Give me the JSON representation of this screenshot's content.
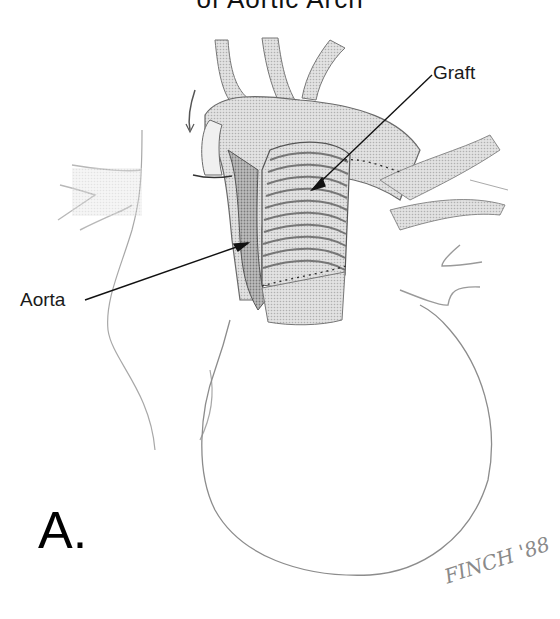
{
  "figure": {
    "title_partial": "of Aortic Arch",
    "panel_label": "A.",
    "signature": "FINCH '88",
    "labels": [
      {
        "id": "graft",
        "text": "Graft"
      },
      {
        "id": "aorta",
        "text": "Aorta"
      }
    ],
    "colors": {
      "ink": "#1a1a1a",
      "line_gray": "#9a9a9a",
      "shade_dark": "#8c8c8c",
      "shade_light": "#d6d6d6",
      "background": "#ffffff"
    }
  }
}
